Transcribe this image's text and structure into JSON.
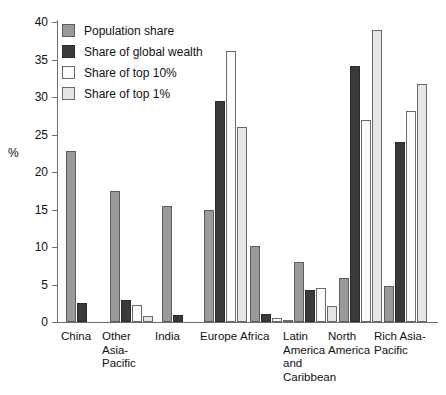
{
  "chart_data": {
    "type": "bar",
    "title": "",
    "xlabel": "",
    "ylabel": "%",
    "ylim": [
      0,
      40
    ],
    "yticks": [
      0,
      5,
      10,
      15,
      20,
      25,
      30,
      35,
      40
    ],
    "grid": false,
    "legend_position": "top-left",
    "categories": [
      "China",
      "Other Asia-Pacific",
      "India",
      "Europe",
      "Africa",
      "Latin America and Caribbean",
      "North America",
      "Rich Asia-Pacific"
    ],
    "category_display": [
      "China",
      "Other\nAsia-Pacific",
      "India",
      "Europe",
      "Africa",
      "Latin\nAmerica\nand\nCaribbean",
      "North\nAmerica",
      "Rich Asia-\nPacific"
    ],
    "series": [
      {
        "name": "Population share",
        "color": "#9a9a9a",
        "values": [
          22.8,
          17.5,
          15.5,
          14.9,
          10.2,
          8.0,
          5.9,
          4.8
        ]
      },
      {
        "name": "Share of global wealth",
        "color": "#3a3a3a",
        "values": [
          2.6,
          3.0,
          1.0,
          29.5,
          1.1,
          4.3,
          34.2,
          24.0
        ]
      },
      {
        "name": "Share of top 10%",
        "color": "#fbfbfb",
        "values": [
          0.0,
          2.3,
          0.0,
          36.1,
          0.6,
          4.6,
          27.0,
          28.2
        ]
      },
      {
        "name": "Share of top 1%",
        "color": "#e6e6e6",
        "values": [
          0.0,
          0.8,
          0.0,
          26.0,
          0.2,
          2.2,
          38.9,
          31.7
        ]
      }
    ]
  },
  "legend": {
    "items": [
      {
        "label": "Population share"
      },
      {
        "label": "Share of global wealth"
      },
      {
        "label": "Share of top 10%"
      },
      {
        "label": "Share of top 1%"
      }
    ]
  }
}
